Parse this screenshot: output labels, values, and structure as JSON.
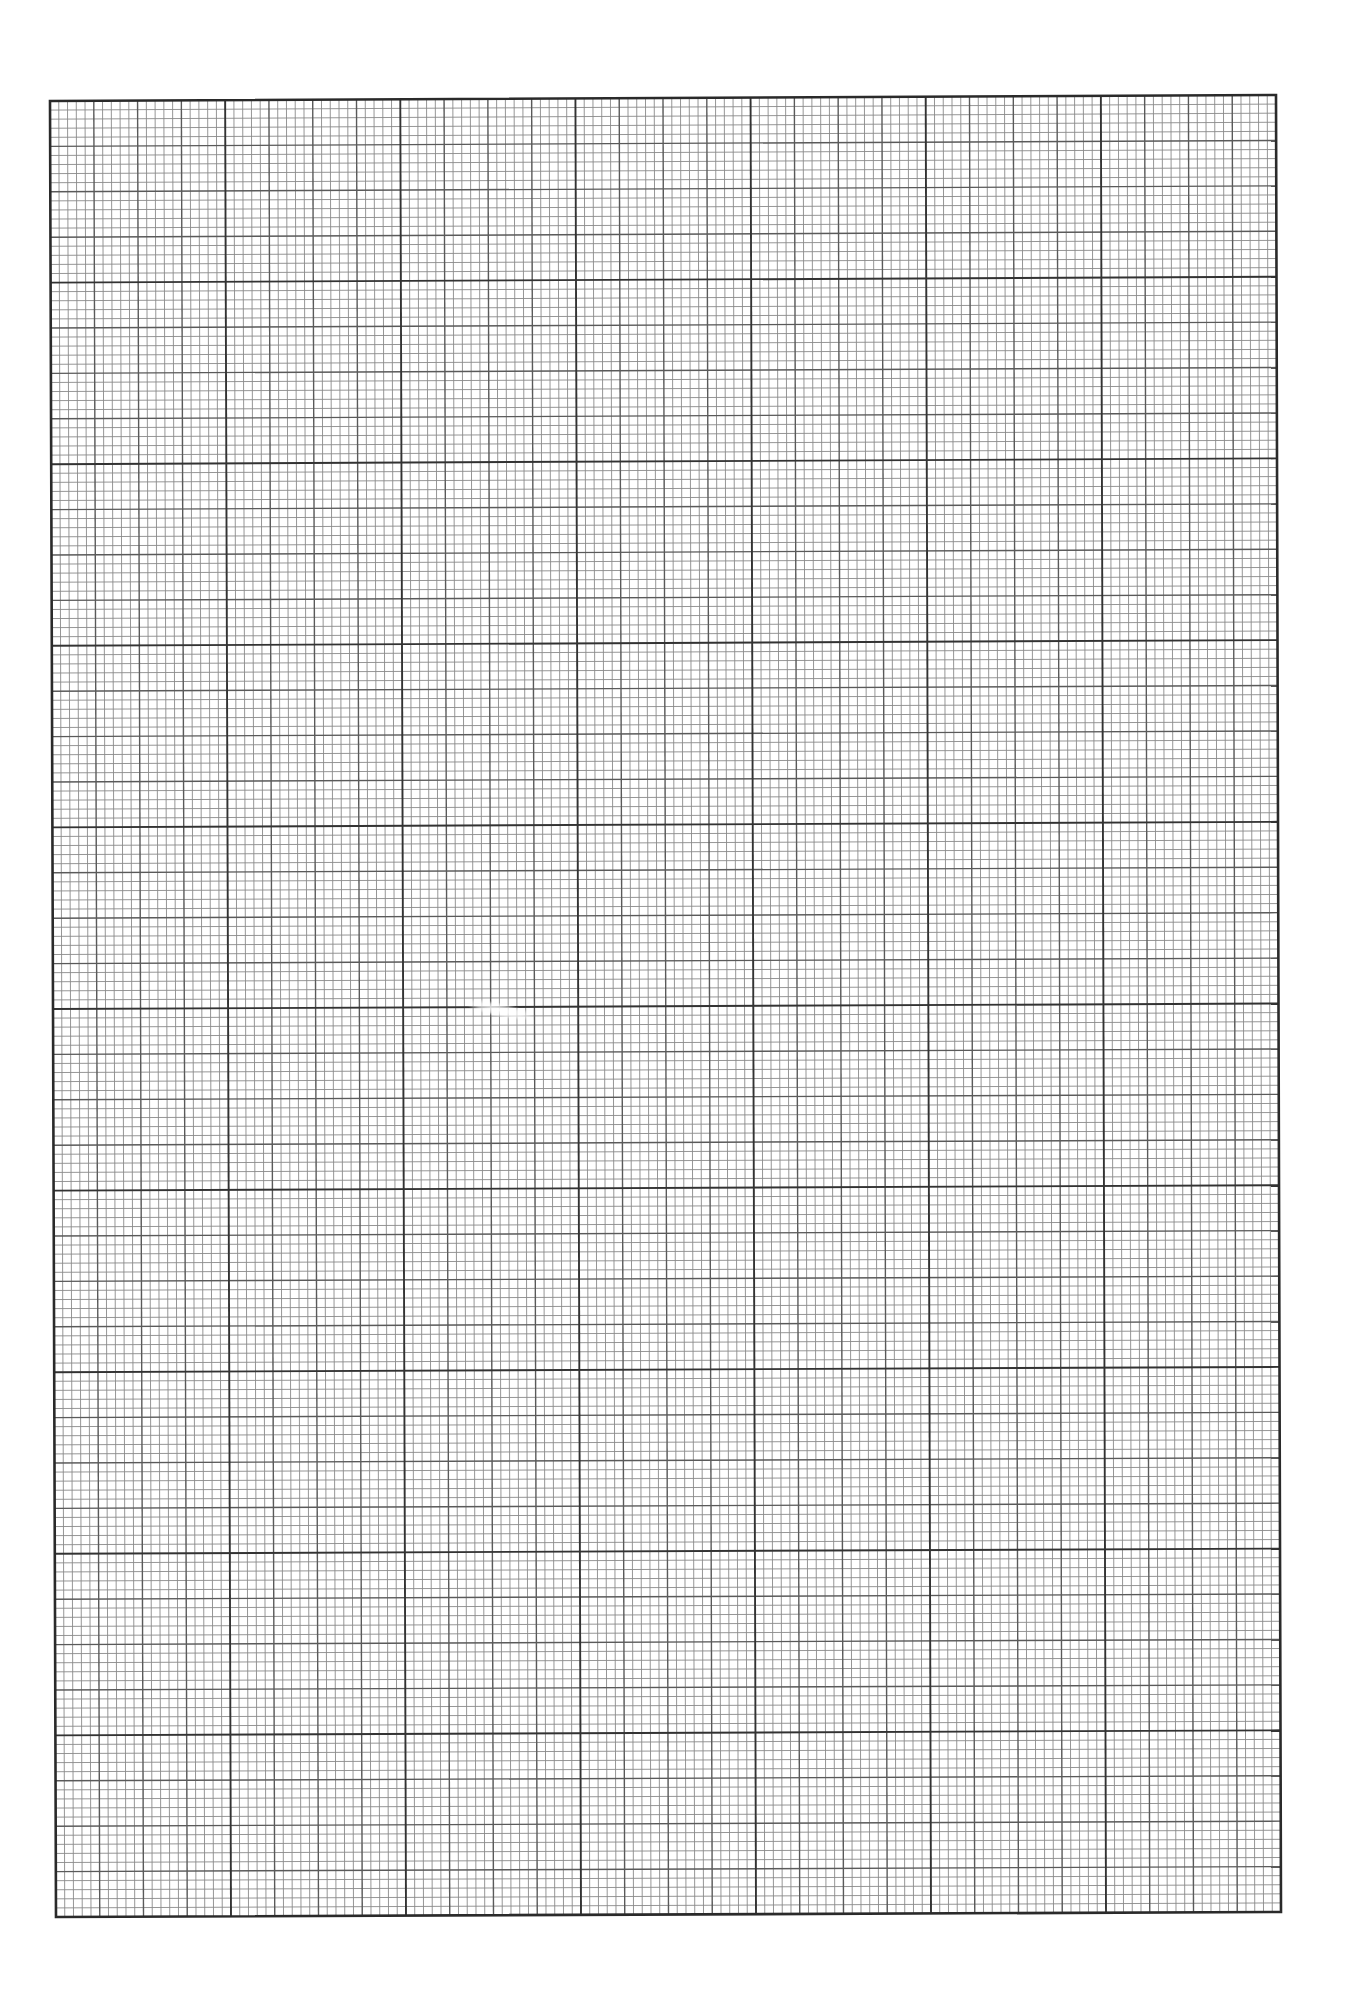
{
  "page": {
    "width": 1345,
    "height": 2001,
    "background": "#ffffff"
  },
  "grid": {
    "corners": {
      "top_left": [
        50,
        101
      ],
      "top_right": [
        1276,
        95
      ],
      "bottom_left": [
        56,
        1917
      ],
      "bottom_right": [
        1281,
        1912
      ]
    },
    "major_columns": 7,
    "major_rows": 10,
    "medium_per_major": 4,
    "small_per_medium": 5,
    "colors": {
      "small_line": "#8a8a8a",
      "medium_line": "#5a5a5a",
      "major_line": "#333333",
      "border": "#2a2a2a"
    },
    "widths": {
      "small_line": 0.9,
      "medium_line": 1.4,
      "major_line": 1.9,
      "border": 2.6
    }
  },
  "artifacts": [
    {
      "kind": "scan-speck",
      "x": 465,
      "y": 1003,
      "w": 70,
      "h": 14,
      "rotation": 12
    }
  ]
}
